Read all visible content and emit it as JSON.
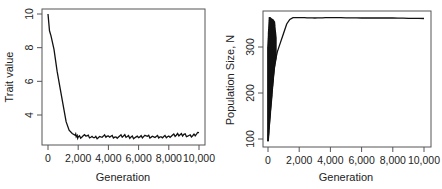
{
  "chart_data": [
    {
      "type": "line",
      "title": "",
      "xlabel": "Generation",
      "ylabel": "Trait value",
      "xlim": [
        0,
        10000
      ],
      "ylim": [
        2.4,
        10.3
      ],
      "grid": false,
      "legend": null,
      "x_ticks": [
        0,
        2000,
        4000,
        6000,
        8000,
        10000
      ],
      "x_tick_labels": [
        "0",
        "2,000",
        "4,000",
        "6,000",
        "8,000",
        "10,000"
      ],
      "y_ticks": [
        4,
        6,
        8,
        10
      ],
      "y_tick_labels": [
        "4",
        "6",
        "8",
        "10"
      ],
      "series": [
        {
          "name": "Trait value",
          "x": [
            0,
            100,
            200,
            400,
            600,
            800,
            1000,
            1200,
            1400,
            1600,
            1800,
            2000,
            2500,
            3000,
            3500,
            4000,
            4500,
            5000,
            5500,
            6000,
            6500,
            7000,
            7500,
            8000,
            8500,
            9000,
            9500,
            10000
          ],
          "values": [
            10.0,
            9.0,
            8.7,
            7.9,
            6.6,
            5.6,
            4.6,
            3.6,
            3.1,
            2.9,
            2.8,
            2.7,
            2.75,
            2.65,
            2.7,
            2.75,
            2.7,
            2.75,
            2.7,
            2.65,
            2.75,
            2.7,
            2.7,
            2.75,
            2.8,
            2.85,
            2.7,
            2.95
          ]
        }
      ]
    },
    {
      "type": "line",
      "title": "",
      "xlabel": "Generation",
      "ylabel": "Population Size, N",
      "xlim": [
        0,
        10000
      ],
      "ylim": [
        90,
        375
      ],
      "grid": false,
      "legend": null,
      "x_ticks": [
        0,
        2000,
        4000,
        6000,
        8000,
        10000
      ],
      "x_tick_labels": [
        "0",
        "2,000",
        "4,000",
        "6,000",
        "8,000",
        "10,000"
      ],
      "y_ticks": [
        100,
        200,
        300
      ],
      "y_tick_labels": [
        "100",
        "200",
        "300"
      ],
      "annotations": [
        "Dense oscillation between ~95 and ~365 for generations 0-500"
      ],
      "series": [
        {
          "name": "Population size (lower envelope / trend)",
          "x": [
            0,
            100,
            200,
            300,
            400,
            500,
            600,
            800,
            1000,
            1200,
            1400,
            1600,
            2000,
            3000,
            4000,
            6000,
            8000,
            10000
          ],
          "values": [
            95,
            140,
            180,
            220,
            255,
            275,
            290,
            310,
            330,
            350,
            360,
            364,
            364,
            363,
            364,
            363,
            363,
            362
          ]
        },
        {
          "name": "Population size (upper envelope)",
          "x": [
            0,
            100,
            200,
            300,
            400,
            500
          ],
          "values": [
            300,
            365,
            362,
            360,
            355,
            320
          ]
        }
      ]
    }
  ]
}
